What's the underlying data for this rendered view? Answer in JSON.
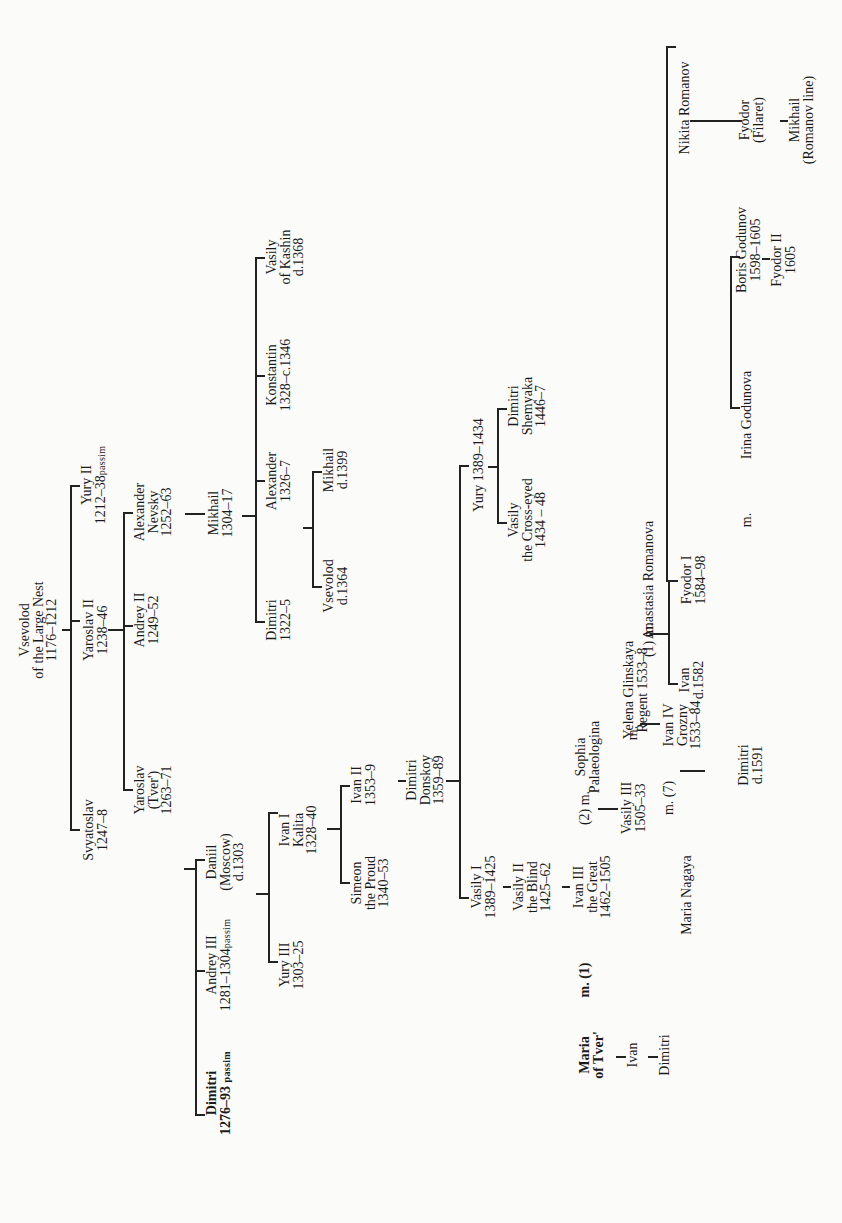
{
  "diagram": {
    "type": "family-tree",
    "orientation": "rotated-90",
    "line_color": "#222222",
    "background": "#fbfbf9"
  },
  "nodes": {
    "vsevolod": {
      "l1": "Vsevolod",
      "l2": "of the Large Nest",
      "l3": "1176–1212"
    },
    "yury2": {
      "l1": "Yury II",
      "l2": "1212–38",
      "sub": "passim"
    },
    "yaroslav2": {
      "l1": "Yaroslav  II",
      "l2": "1238–46"
    },
    "svyatoslav": {
      "l1": "Svyatoslav",
      "l2": "1247–8"
    },
    "alexander_nevsky": {
      "l1": "Alexander",
      "l2": "Nevsky",
      "l3": "1252–63"
    },
    "andrey2": {
      "l1": "Andrey  II",
      "l2": "1249–52"
    },
    "yaroslav_tver": {
      "l1": "Yaroslav",
      "l2": "(Tver')",
      "l3": "1263–71"
    },
    "mikhail_1304": {
      "l1": "Mikhail",
      "l2": "1304–17"
    },
    "dimitri_1322": {
      "l1": "Dimitri",
      "l2": "1322–5"
    },
    "alexander_1326": {
      "l1": "Alexander",
      "l2": "1326–7"
    },
    "konstantin": {
      "l1": "Konstantin",
      "l2": "1328–c.1346"
    },
    "vasily_kashin": {
      "l1": "Vasily",
      "l2": "of Kashin",
      "l3": "d.1368"
    },
    "vsevolod_1364": {
      "l1": "Vsevolod",
      "l2": "d.1364"
    },
    "mikhail_1399": {
      "l1": "Mikhail",
      "l2": "d.1399"
    },
    "dimitri_1276": {
      "l1": "Dimitri",
      "l2": "1276–93",
      "sub": "passim"
    },
    "andrey3": {
      "l1": "Andrey III",
      "l2": "1281–1304",
      "sub": "passim"
    },
    "daniil": {
      "l1": "Daniil",
      "l2": "(Moscow)",
      "l3": "d.1303"
    },
    "yury3": {
      "l1": "Yury III",
      "l2": "1303–25"
    },
    "ivan1": {
      "l1": "Ivan I",
      "l2": "Kalita",
      "l3": "1328–40"
    },
    "simeon": {
      "l1": "Simeon",
      "l2": "the Proud",
      "l3": "1340–53"
    },
    "ivan2": {
      "l1": "Ivan II",
      "l2": "1353–9"
    },
    "dimitri_donskoy": {
      "l1": "Dimitri",
      "l2": "Donskoy",
      "l3": "1359–89"
    },
    "vasily1": {
      "l1": "Vasily  I",
      "l2": "1389–1425"
    },
    "yury_1389": {
      "l1": "Yury  1389–1434"
    },
    "vasily_crosseyed": {
      "l1": "Vasily",
      "l2": "the Cross-eyed",
      "l3": "1434 – 48"
    },
    "dimitri_shemyaka": {
      "l1": "Dimitri",
      "l2": "Shemyaka",
      "l3": "1446–7"
    },
    "vasily2": {
      "l1": "Vasily II",
      "l2": "the Blind",
      "l3": "1425–62"
    },
    "ivan3": {
      "l1": "Ivan III",
      "l2": "the Great",
      "l3": "1462–1505"
    },
    "sophia": {
      "l1": "Sophia",
      "l2": "Palaeologina"
    },
    "vasily3": {
      "l1": "Vasily  III",
      "l2": "1505–33"
    },
    "yelena": {
      "l1": "Yelena Glinskaya",
      "l2": "Regent  1533–8"
    },
    "ivan4": {
      "l1": "Ivan IV",
      "l2": "Grozny",
      "l3": "1533–84"
    },
    "anastasia": {
      "l1": "Anastasia Romanova"
    },
    "nikita": {
      "l1": "Nikita Romanov"
    },
    "maria_nagaya": {
      "l1": "Maria Nagaya"
    },
    "dimitri_1591": {
      "l1": "Dimitri",
      "l2": "d.1591"
    },
    "ivan_1582": {
      "l1": "Ivan",
      "l2": "d.1582"
    },
    "fyodor1": {
      "l1": "Fyodor I",
      "l2": "1584–98"
    },
    "irina": {
      "l1": "Irina Godunova"
    },
    "boris": {
      "l1": "Boris Godunov",
      "l2": "1598–1605"
    },
    "fyodor2": {
      "l1": "Fyodor  II",
      "l2": "1605"
    },
    "fyodor_filaret": {
      "l1": "Fyodor",
      "l2": "(Filaret)"
    },
    "mikhail_romanov": {
      "l1": "Mikhail",
      "l2": "(Romanov line)"
    },
    "maria_tver": {
      "l1": "Maria",
      "l2": "of Tver'"
    },
    "ivan_tver": {
      "l1": "Ivan"
    },
    "dimitri_tver": {
      "l1": "Dimitri"
    }
  },
  "marks": {
    "m1_ivan3": "m. (1)",
    "m2_ivan3": "(2) m.",
    "m_vasily3": "m.",
    "m1_ivan4": "(1)  m.",
    "m7_ivan4": "m. (7)",
    "m_fyodor1": "m."
  }
}
